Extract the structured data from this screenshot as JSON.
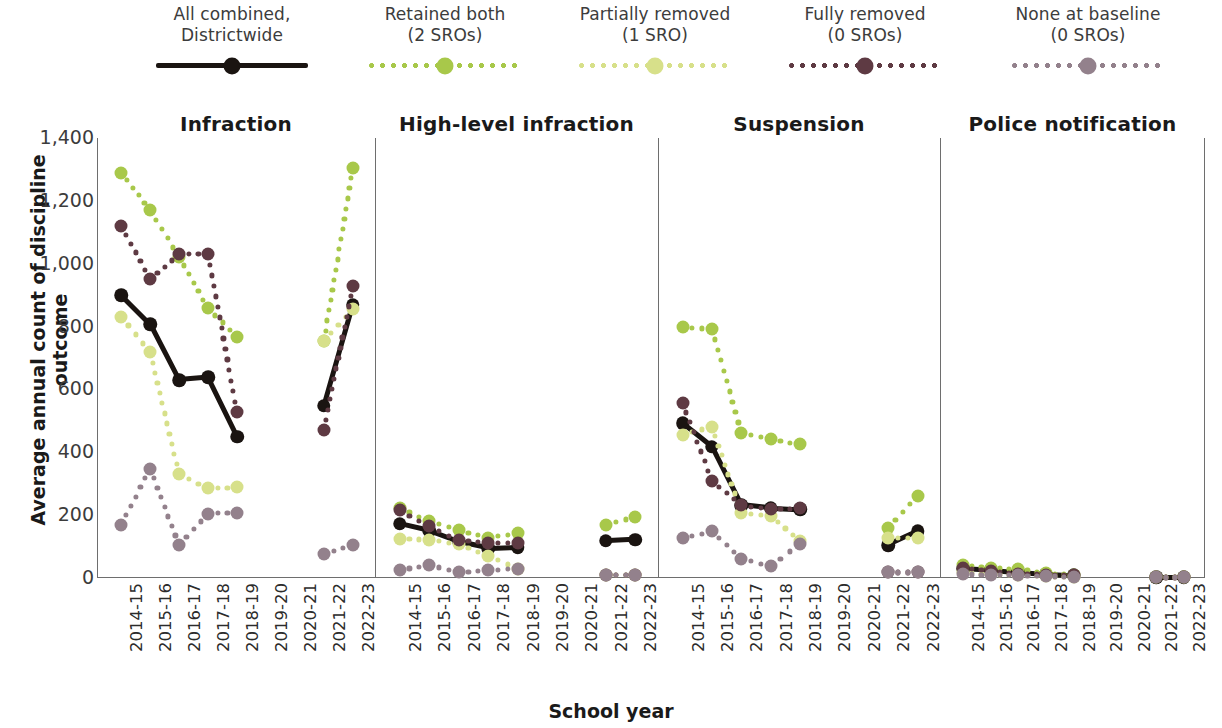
{
  "axes": {
    "y_title": "Average annual count of discipline outcome",
    "x_title": "School year",
    "y_ticks": [
      "1,400",
      "1,200",
      "1,000",
      "800",
      "600",
      "400",
      "200",
      "0"
    ]
  },
  "legend": [
    {
      "label": "All combined,\nDistrictwide",
      "style": "solid",
      "color": "#1a1411"
    },
    {
      "label": "Retained both\n(2 SROs)",
      "style": "dotted",
      "color": "#a8c84a"
    },
    {
      "label": "Partially removed\n(1 SRO)",
      "style": "dotted",
      "color": "#d7e08a"
    },
    {
      "label": "Fully removed\n(0 SROs)",
      "style": "dotted",
      "color": "#5e3a43"
    },
    {
      "label": "None at baseline\n(0 SROs)",
      "style": "dotted",
      "color": "#93818c"
    }
  ],
  "panels": [
    "Infraction",
    "High-level infraction",
    "Suspension",
    "Police notification"
  ],
  "chart_data": {
    "type": "line",
    "xlabel": "School year",
    "ylabel": "Average annual count of discipline outcome",
    "ylim": [
      0,
      1400
    ],
    "grid": false,
    "legend_position": "top",
    "categories": [
      "2014-15",
      "2015-16",
      "2016-17",
      "2017-18",
      "2018-19",
      "2019-20",
      "2020-21",
      "2021-22",
      "2022-23"
    ],
    "facets": [
      {
        "name": "Infraction",
        "series": [
          {
            "name": "All combined, Districtwide",
            "color": "#1a1411",
            "style": "solid",
            "values": [
              900,
              808,
              630,
              638,
              450,
              null,
              null,
              548,
              870
            ]
          },
          {
            "name": "Retained both (2 SROs)",
            "color": "#a8c84a",
            "style": "dotted",
            "values": [
              1290,
              1170,
              1022,
              858,
              768,
              null,
              null,
              755,
              1305
            ]
          },
          {
            "name": "Partially removed (1 SRO)",
            "color": "#d7e08a",
            "style": "dotted",
            "values": [
              832,
              718,
              330,
              285,
              288,
              null,
              null,
              755,
              855
            ]
          },
          {
            "name": "Fully removed (0 SROs)",
            "color": "#5e3a43",
            "style": "dotted",
            "values": [
              1120,
              952,
              1030,
              1030,
              528,
              null,
              null,
              470,
              930
            ]
          },
          {
            "name": "None at baseline (0 SROs)",
            "color": "#93818c",
            "style": "dotted",
            "values": [
              170,
              348,
              105,
              205,
              208,
              null,
              null,
              75,
              105
            ]
          }
        ]
      },
      {
        "name": "High-level infraction",
        "series": [
          {
            "name": "All combined, Districtwide",
            "color": "#1a1411",
            "style": "solid",
            "values": [
              172,
              150,
              115,
              95,
              98,
              null,
              null,
              118,
              122
            ]
          },
          {
            "name": "Retained both (2 SROs)",
            "color": "#a8c84a",
            "style": "dotted",
            "values": [
              222,
              182,
              152,
              128,
              142,
              null,
              null,
              170,
              195
            ]
          },
          {
            "name": "Partially removed (1 SRO)",
            "color": "#d7e08a",
            "style": "dotted",
            "values": [
              125,
              122,
              108,
              70,
              30,
              null,
              null,
              8,
              10
            ]
          },
          {
            "name": "Fully removed (0 SROs)",
            "color": "#5e3a43",
            "style": "dotted",
            "values": [
              215,
              165,
              120,
              112,
              112,
              null,
              null,
              10,
              10
            ]
          },
          {
            "name": "None at baseline (0 SROs)",
            "color": "#93818c",
            "style": "dotted",
            "values": [
              25,
              42,
              18,
              25,
              30,
              null,
              null,
              10,
              8
            ]
          }
        ]
      },
      {
        "name": "Suspension",
        "series": [
          {
            "name": "All combined, Districtwide",
            "color": "#1a1411",
            "style": "solid",
            "values": [
              492,
              418,
              232,
              222,
              218,
              null,
              null,
              105,
              148
            ]
          },
          {
            "name": "Retained both (2 SROs)",
            "color": "#a8c84a",
            "style": "dotted",
            "values": [
              798,
              792,
              462,
              442,
              425,
              null,
              null,
              160,
              262
            ]
          },
          {
            "name": "Partially removed (1 SRO)",
            "color": "#d7e08a",
            "style": "dotted",
            "values": [
              455,
              482,
              208,
              198,
              118,
              null,
              null,
              128,
              128
            ]
          },
          {
            "name": "Fully removed (0 SROs)",
            "color": "#5e3a43",
            "style": "dotted",
            "values": [
              558,
              310,
              232,
              218,
              222,
              null,
              null,
              18,
              18
            ]
          },
          {
            "name": "None at baseline (0 SROs)",
            "color": "#93818c",
            "style": "dotted",
            "values": [
              128,
              148,
              62,
              38,
              108,
              null,
              null,
              18,
              18
            ]
          }
        ]
      },
      {
        "name": "Police notification",
        "series": [
          {
            "name": "All combined, Districtwide",
            "color": "#1a1411",
            "style": "solid",
            "values": [
              30,
              25,
              18,
              12,
              8,
              null,
              null,
              2,
              2
            ]
          },
          {
            "name": "Retained both (2 SROs)",
            "color": "#a8c84a",
            "style": "dotted",
            "values": [
              40,
              32,
              28,
              16,
              10,
              null,
              null,
              4,
              4
            ]
          },
          {
            "name": "Partially removed (1 SRO)",
            "color": "#d7e08a",
            "style": "dotted",
            "values": [
              18,
              12,
              10,
              6,
              4,
              null,
              null,
              2,
              2
            ]
          },
          {
            "name": "Fully removed (0 SROs)",
            "color": "#5e3a43",
            "style": "dotted",
            "values": [
              32,
              22,
              14,
              10,
              8,
              null,
              null,
              2,
              2
            ]
          },
          {
            "name": "None at baseline (0 SROs)",
            "color": "#93818c",
            "style": "dotted",
            "values": [
              12,
              10,
              8,
              6,
              4,
              null,
              null,
              2,
              2
            ]
          }
        ]
      }
    ]
  }
}
